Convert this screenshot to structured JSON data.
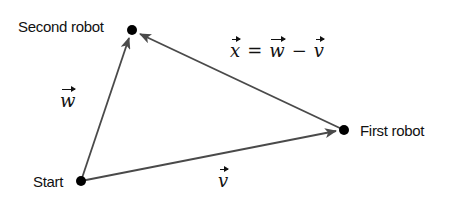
{
  "diagram": {
    "type": "vector-triangle",
    "colors": {
      "line": "#4a4a4a",
      "point": "#000000",
      "text": "#111111"
    },
    "points": [
      {
        "id": "start",
        "label": "Start",
        "x": 81,
        "y": 181
      },
      {
        "id": "second_robot",
        "label": "Second robot",
        "x": 132,
        "y": 30
      },
      {
        "id": "first_robot",
        "label": "First robot",
        "x": 344,
        "y": 130
      }
    ],
    "vectors": [
      {
        "id": "w",
        "symbol": "w",
        "from": "start",
        "to": "second_robot"
      },
      {
        "id": "v",
        "symbol": "v",
        "from": "start",
        "to": "first_robot"
      },
      {
        "id": "x",
        "symbol": "x",
        "from": "first_robot",
        "to": "second_robot"
      }
    ],
    "equation": {
      "lhs": "x",
      "eq": "=",
      "term1": "w",
      "op": "−",
      "term2": "v"
    }
  }
}
